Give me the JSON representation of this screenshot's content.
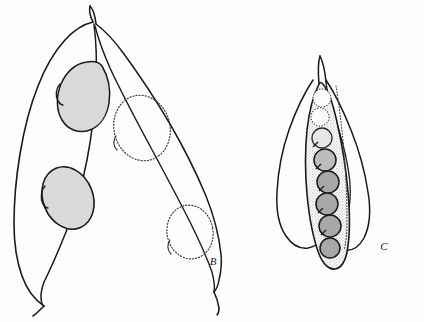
{
  "plate": {
    "title": "Legume pod and seed illustration plate",
    "background_color": "#fefefe",
    "ink_color": "#1a1a1a",
    "seed_fill_color": "#d9d9d7",
    "seed_dark_fill_color": "#a8a8a6",
    "pod_interior_stipple_color": "#cfcfcd"
  },
  "figures": [
    {
      "id": "figure-b",
      "label": "B",
      "label_x": 213,
      "label_y": 265,
      "description": "Pair of broad flattened legume pods; front pod shows two gray-shaded seeds, rear pod shows two dotted seed outlines",
      "pods": [
        {
          "name": "front-pod",
          "seed_count": 2,
          "seed_style": "shaded",
          "seeds": [
            {
              "cx": 86,
              "cy": 88,
              "rx": 25,
              "ry": 30,
              "rot": -18,
              "fill": "#d9d9d7"
            },
            {
              "cx": 68,
              "cy": 198,
              "rx": 25,
              "ry": 32,
              "rot": -22,
              "fill": "#d9d9d7"
            }
          ]
        },
        {
          "name": "rear-pod",
          "seed_count": 2,
          "seed_style": "dotted-outline",
          "seeds": [
            {
              "cx": 142,
              "cy": 128,
              "rx": 27,
              "ry": 32,
              "rot": -12,
              "fill": "none"
            },
            {
              "cx": 190,
              "cy": 232,
              "rx": 22,
              "ry": 26,
              "rot": -10,
              "fill": "none"
            }
          ]
        }
      ]
    },
    {
      "id": "figure-c",
      "label": "C",
      "label_x": 384,
      "label_y": 250,
      "description": "Narrow elongate pod with stippled interior containing eight rounded seeds, flanked by two lateral pod valves",
      "pods": [
        {
          "name": "central-pod",
          "seed_count": 8,
          "seed_style": "graded",
          "seeds": [
            {
              "cx": 322,
              "cy": 98,
              "r": 9,
              "fill": "none"
            },
            {
              "cx": 320,
              "cy": 117,
              "r": 9,
              "fill": "none"
            },
            {
              "cx": 322,
              "cy": 138,
              "r": 10,
              "fill": "#e2e2e0"
            },
            {
              "cx": 325,
              "cy": 160,
              "r": 11,
              "fill": "#b8b8b6"
            },
            {
              "cx": 328,
              "cy": 182,
              "r": 11,
              "fill": "#a8a8a6"
            },
            {
              "cx": 327,
              "cy": 204,
              "r": 11,
              "fill": "#a8a8a6"
            },
            {
              "cx": 330,
              "cy": 226,
              "r": 11,
              "fill": "#a8a8a6"
            },
            {
              "cx": 330,
              "cy": 248,
              "r": 10,
              "fill": "#a8a8a6"
            }
          ]
        },
        {
          "name": "left-valve",
          "seed_count": 0,
          "seed_style": "none",
          "seeds": []
        },
        {
          "name": "right-valve",
          "seed_count": 0,
          "seed_style": "none",
          "seeds": []
        }
      ]
    }
  ]
}
